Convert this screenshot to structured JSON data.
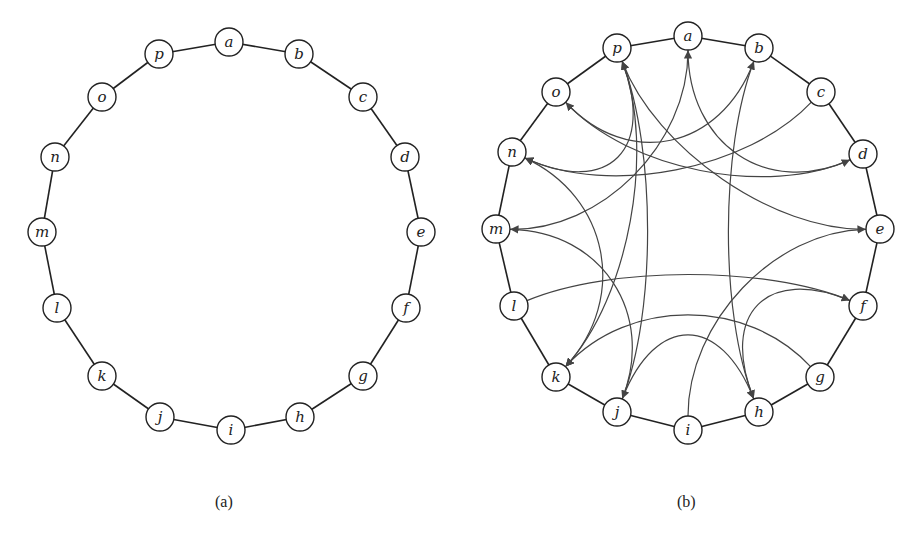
{
  "figure_a": {
    "caption": "(a)",
    "nodes": [
      {
        "id": "a",
        "x": 229,
        "y": 42
      },
      {
        "id": "b",
        "x": 299,
        "y": 54
      },
      {
        "id": "c",
        "x": 363,
        "y": 97
      },
      {
        "id": "d",
        "x": 405,
        "y": 157
      },
      {
        "id": "e",
        "x": 421,
        "y": 232
      },
      {
        "id": "f",
        "x": 406,
        "y": 308
      },
      {
        "id": "g",
        "x": 363,
        "y": 376
      },
      {
        "id": "h",
        "x": 300,
        "y": 417
      },
      {
        "id": "i",
        "x": 231,
        "y": 430
      },
      {
        "id": "j",
        "x": 160,
        "y": 417
      },
      {
        "id": "k",
        "x": 102,
        "y": 376
      },
      {
        "id": "l",
        "x": 57,
        "y": 308
      },
      {
        "id": "m",
        "x": 42,
        "y": 232
      },
      {
        "id": "n",
        "x": 55,
        "y": 157
      },
      {
        "id": "o",
        "x": 102,
        "y": 97
      },
      {
        "id": "p",
        "x": 159,
        "y": 54
      }
    ]
  },
  "figure_b": {
    "caption": "(b)",
    "nodes": [
      {
        "id": "a",
        "x": 688,
        "y": 36
      },
      {
        "id": "b",
        "x": 759,
        "y": 48
      },
      {
        "id": "c",
        "x": 821,
        "y": 92
      },
      {
        "id": "d",
        "x": 863,
        "y": 154
      },
      {
        "id": "e",
        "x": 880,
        "y": 229
      },
      {
        "id": "f",
        "x": 863,
        "y": 306
      },
      {
        "id": "g",
        "x": 820,
        "y": 377
      },
      {
        "id": "h",
        "x": 759,
        "y": 412
      },
      {
        "id": "i",
        "x": 688,
        "y": 430
      },
      {
        "id": "j",
        "x": 617,
        "y": 412
      },
      {
        "id": "k",
        "x": 556,
        "y": 377
      },
      {
        "id": "l",
        "x": 514,
        "y": 306
      },
      {
        "id": "m",
        "x": 496,
        "y": 229
      },
      {
        "id": "n",
        "x": 512,
        "y": 152
      },
      {
        "id": "o",
        "x": 556,
        "y": 92
      },
      {
        "id": "p",
        "x": 617,
        "y": 48
      }
    ],
    "chords": [
      {
        "from": "p",
        "to": "n"
      },
      {
        "from": "a",
        "to": "d"
      },
      {
        "from": "o",
        "to": "b"
      },
      {
        "from": "c",
        "to": "n"
      },
      {
        "from": "d",
        "to": "o"
      },
      {
        "from": "e",
        "to": "p"
      },
      {
        "from": "m",
        "to": "a"
      },
      {
        "from": "n",
        "to": "k"
      },
      {
        "from": "j",
        "to": "p"
      },
      {
        "from": "b",
        "to": "h"
      },
      {
        "from": "l",
        "to": "f"
      },
      {
        "from": "f",
        "to": "h"
      },
      {
        "from": "g",
        "to": "k"
      },
      {
        "from": "h",
        "to": "j"
      },
      {
        "from": "i",
        "to": "e"
      },
      {
        "from": "j",
        "to": "m"
      },
      {
        "from": "p",
        "to": "k"
      }
    ]
  }
}
